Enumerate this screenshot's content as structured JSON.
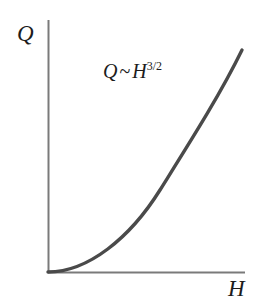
{
  "figure": {
    "background_color": "#ffffff",
    "width": 258,
    "height": 308
  },
  "axes": {
    "y_label": "Q",
    "x_label": "H",
    "axis_color": "#7a7a7a",
    "origin_x": 48,
    "origin_y": 272,
    "x_axis_end": 245,
    "y_axis_top": 20
  },
  "annotation": {
    "base": "Q",
    "relation": "~",
    "variable": "H",
    "exponent": "3/2",
    "full_text": "Q ~ H^3/2"
  },
  "curve": {
    "color": "#4a4a4a",
    "stroke_width": 3.4,
    "path": "M 48 272 C 88 272, 130 238, 160 190 C 190 142, 220 95, 242 50"
  },
  "chart_data": {
    "type": "line",
    "title": "",
    "xlabel": "H",
    "ylabel": "Q",
    "annotations": [
      "Q ~ H^3/2"
    ],
    "grid": false,
    "legend": "none",
    "xlim": [
      0,
      1
    ],
    "ylim": [
      0,
      1
    ],
    "series": [
      {
        "name": "Q ~ H^3/2",
        "relation": "Q = H^1.5",
        "x": [
          0.0,
          0.1,
          0.2,
          0.3,
          0.4,
          0.5,
          0.6,
          0.7,
          0.8,
          0.9,
          1.0
        ],
        "y": [
          0.0,
          0.032,
          0.089,
          0.164,
          0.253,
          0.354,
          0.465,
          0.586,
          0.715,
          0.854,
          1.0
        ]
      }
    ]
  }
}
